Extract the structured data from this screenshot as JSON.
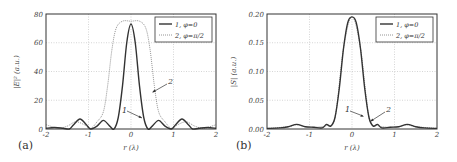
{
  "chart_data": [
    {
      "panel": "(a)",
      "type": "line",
      "title": "",
      "xlabel": "r (λ)",
      "ylabel": "|E|² (a.u.)",
      "xlim": [
        -2,
        2
      ],
      "ylim": [
        0,
        80
      ],
      "xticks": [
        "-2",
        "-1",
        "0",
        "1",
        "2"
      ],
      "yticks": [
        "0",
        "20",
        "40",
        "60",
        "80"
      ],
      "grid": true,
      "legend_position": "upper right",
      "legend": [
        "1, φ=0",
        "2, φ=π/2"
      ],
      "annotations": [
        {
          "text": "1",
          "points_to": "series 1 right flank near r≈0.35"
        },
        {
          "text": "2",
          "points_to": "series 2 right flank near r≈0.55"
        }
      ],
      "series": [
        {
          "name": "1, φ=0",
          "style": "solid",
          "x": [
            -2.0,
            -1.8,
            -1.6,
            -1.45,
            -1.35,
            -1.2,
            -1.05,
            -0.95,
            -0.8,
            -0.65,
            -0.5,
            -0.4,
            -0.3,
            -0.2,
            -0.1,
            0.0,
            0.1,
            0.2,
            0.3,
            0.4,
            0.5,
            0.65,
            0.8,
            0.95,
            1.05,
            1.2,
            1.35,
            1.45,
            1.6,
            1.8,
            2.0
          ],
          "y": [
            0.5,
            1,
            0.5,
            0,
            3,
            7,
            3,
            0,
            2,
            6,
            2,
            0,
            8,
            30,
            60,
            73,
            60,
            30,
            8,
            0,
            2,
            6,
            2,
            0,
            3,
            7,
            3,
            0,
            0.5,
            1,
            0.5
          ]
        },
        {
          "name": "2, φ=π/2",
          "style": "dotted",
          "x": [
            -2.0,
            -1.9,
            -1.7,
            -1.5,
            -1.3,
            -1.1,
            -0.95,
            -0.8,
            -0.65,
            -0.55,
            -0.45,
            -0.35,
            -0.2,
            0.0,
            0.2,
            0.35,
            0.45,
            0.55,
            0.65,
            0.8,
            0.95,
            1.1,
            1.3,
            1.5,
            1.7,
            1.9,
            2.0
          ],
          "y": [
            3,
            2,
            0.5,
            2,
            5,
            3,
            0.5,
            5,
            12,
            30,
            55,
            70,
            75,
            75,
            75,
            70,
            55,
            30,
            12,
            5,
            0.5,
            3,
            5,
            2,
            0.5,
            2,
            3
          ]
        }
      ]
    },
    {
      "panel": "(b)",
      "type": "line",
      "title": "",
      "xlabel": "r (λ)",
      "ylabel": "|S| (a.u.)",
      "xlim": [
        -2,
        2
      ],
      "ylim": [
        0,
        0.2
      ],
      "xticks": [
        "-2",
        "-1",
        "0",
        "1",
        "2"
      ],
      "yticks": [
        "0.00",
        "0.05",
        "0.10",
        "0.15",
        "0.20"
      ],
      "grid": true,
      "legend_position": "upper right",
      "legend": [
        "1, φ=0",
        "2, φ=π/2"
      ],
      "annotations": [
        {
          "text": "1",
          "points_to": "curve right flank near r≈0.3"
        },
        {
          "text": "2",
          "points_to": "curve right flank near r≈0.4"
        }
      ],
      "series": [
        {
          "name": "1, φ=0",
          "style": "solid",
          "x": [
            -2.0,
            -1.7,
            -1.5,
            -1.3,
            -1.1,
            -0.9,
            -0.7,
            -0.6,
            -0.5,
            -0.4,
            -0.3,
            -0.2,
            -0.1,
            0.0,
            0.1,
            0.2,
            0.3,
            0.4,
            0.5,
            0.6,
            0.7,
            0.9,
            1.1,
            1.3,
            1.5,
            1.7,
            2.0
          ],
          "y": [
            0.001,
            0.002,
            0.004,
            0.008,
            0.004,
            0.003,
            0.002,
            0.008,
            0.005,
            0.02,
            0.07,
            0.14,
            0.185,
            0.195,
            0.185,
            0.14,
            0.07,
            0.02,
            0.005,
            0.008,
            0.002,
            0.003,
            0.004,
            0.008,
            0.004,
            0.002,
            0.001
          ]
        },
        {
          "name": "2, φ=π/2",
          "style": "dotted",
          "x": [
            -2.0,
            -1.5,
            -1.3,
            -1.0,
            -0.6,
            -0.4,
            -0.2,
            0.0,
            0.2,
            0.4,
            0.6,
            1.0,
            1.3,
            1.5,
            2.0
          ],
          "y": [
            0.001,
            0.004,
            0.007,
            0.003,
            0.006,
            0.02,
            0.14,
            0.195,
            0.14,
            0.02,
            0.006,
            0.003,
            0.007,
            0.004,
            0.001
          ]
        }
      ]
    }
  ],
  "labels": {
    "panel_a": "(a)",
    "panel_b": "(b)",
    "xlabel": "r (λ)",
    "ylabel_a": "|E|² (a.u.)",
    "ylabel_b": "|S| (a.u.)",
    "legend_1": "1, φ=0",
    "legend_2": "2, φ=π/2",
    "ann_1": "1",
    "ann_2": "2"
  }
}
